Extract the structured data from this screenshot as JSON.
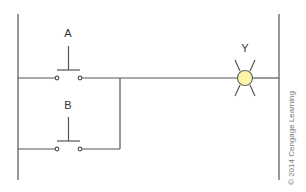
{
  "diagram": {
    "type": "ladder-logic",
    "labels": {
      "contact_a": "A",
      "contact_b": "B",
      "output": "Y"
    },
    "colors": {
      "line": "#555555",
      "lamp_fill": "#fdf5a6",
      "lamp_stroke": "#666666"
    },
    "copyright": "© 2014 Cengage Learning"
  }
}
